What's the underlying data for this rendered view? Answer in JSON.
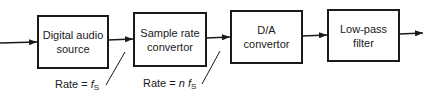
{
  "diagram": {
    "type": "signal-chain block diagram",
    "blocks": [
      {
        "id": "digital-audio-source",
        "line1": "Digital audio",
        "line2": "source"
      },
      {
        "id": "sample-rate-convertor",
        "line1": "Sample rate",
        "line2": "convertor"
      },
      {
        "id": "da-convertor",
        "line1": "D/A",
        "line2": "convertor"
      },
      {
        "id": "low-pass-filter",
        "line1": "Low-pass",
        "line2": "filter"
      }
    ],
    "annotations": [
      {
        "prefix": "Rate = ",
        "mult": "",
        "sym": "f",
        "sub": "S"
      },
      {
        "prefix": "Rate = ",
        "mult": "n ",
        "sym": "f",
        "sub": "S"
      }
    ],
    "stroke_color": "#1a1a1a"
  }
}
